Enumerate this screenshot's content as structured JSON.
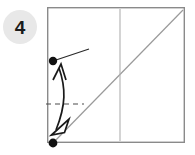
{
  "figure": {
    "step_badge": {
      "label": "4",
      "shape": "circle",
      "fill_color": "#e8e8e8",
      "text_color": "#1b1b1b",
      "center_x": 20,
      "center_y": 27,
      "radius": 17
    },
    "paper": {
      "name": "square-sheet",
      "outline_color": "#8a8a8a",
      "fill_color": "#ffffff",
      "left": 47,
      "top": 7,
      "right": 185,
      "bottom": 143,
      "stroke_width": 1.4
    },
    "creases": [
      {
        "name": "diagonal-crease",
        "type": "line",
        "style": "solid",
        "color": "#9a9a9a",
        "x1": 53,
        "y1": 143,
        "x2": 183,
        "y2": 10
      },
      {
        "name": "vertical-crease",
        "type": "line",
        "style": "solid",
        "color": "#b0b0b0",
        "x1": 120,
        "y1": 9,
        "x2": 120,
        "y2": 141
      },
      {
        "name": "fold-guide-dashed",
        "type": "line",
        "style": "dashed",
        "color": "#4a4a4a",
        "x1": 46,
        "y1": 104,
        "x2": 84,
        "y2": 104,
        "dash_pattern": "5,4"
      }
    ],
    "reference_line": {
      "name": "edge-pointer-line",
      "color": "#2a2a2a",
      "x1": 53,
      "y1": 61,
      "x2": 89,
      "y2": 49
    },
    "points": [
      {
        "name": "upper-corner-dot",
        "x": 53,
        "y": 61,
        "radius": 4.2,
        "color": "#111111"
      },
      {
        "name": "lower-corner-dot",
        "x": 53,
        "y": 143,
        "radius": 4.4,
        "color": "#111111"
      }
    ],
    "fold_arrow": {
      "name": "double-headed-fold-arrow",
      "stroke_color": "#1a1a1a",
      "fill_color": "#ffffff",
      "stroke_width": 1.6,
      "up_head": {
        "name": "arrowhead-up-thin",
        "style": "open-thin",
        "tip_x": 61,
        "tip_y": 65
      },
      "down_head": {
        "name": "arrowhead-down-hollow",
        "style": "hollow-triangle",
        "tip_x": 52,
        "tip_y": 134
      }
    }
  }
}
